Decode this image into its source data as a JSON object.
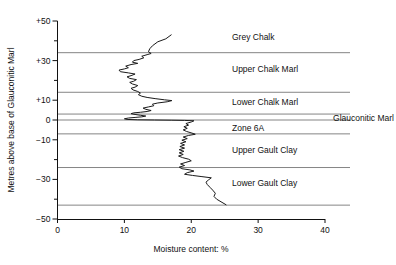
{
  "figure": {
    "background": "#ffffff",
    "line_color": "#1a1a1a",
    "boundary_color": "#777777",
    "axis_color": "#111111"
  },
  "chart_data": {
    "type": "line",
    "title": "",
    "xlabel": "Moisture content: %",
    "ylabel": "Metres above base of Glauconitic Marl",
    "xlim": [
      0,
      40
    ],
    "ylim": [
      -50,
      50
    ],
    "grid": false,
    "legend_position": "none",
    "orientation": "vertical-profile",
    "xticks": [
      0,
      10,
      20,
      30,
      40
    ],
    "xtick_labels": [
      "0",
      "10",
      "20",
      "30",
      "40"
    ],
    "yticks": [
      -50,
      -40,
      -30,
      -20,
      -10,
      0,
      10,
      20,
      30,
      40,
      50
    ],
    "ytick_labels": [
      "−50",
      "",
      "−30",
      "",
      "−10",
      "0",
      "+10",
      "",
      "+30",
      "",
      "+50"
    ],
    "series": [
      {
        "name": "Moisture content profile",
        "x_is_value": true,
        "points": [
          [
            17.0,
            43.0
          ],
          [
            16.2,
            41.0
          ],
          [
            15.0,
            39.5
          ],
          [
            14.2,
            37.5
          ],
          [
            13.8,
            36.0
          ],
          [
            13.6,
            34.5
          ],
          [
            14.0,
            33.6
          ],
          [
            13.4,
            33.0
          ],
          [
            12.6,
            32.2
          ],
          [
            12.9,
            31.4
          ],
          [
            12.2,
            30.6
          ],
          [
            11.4,
            30.0
          ],
          [
            11.2,
            29.2
          ],
          [
            12.0,
            28.6
          ],
          [
            11.0,
            28.0
          ],
          [
            10.2,
            27.2
          ],
          [
            10.6,
            26.4
          ],
          [
            10.0,
            25.8
          ],
          [
            9.2,
            25.2
          ],
          [
            9.4,
            24.4
          ],
          [
            10.6,
            23.8
          ],
          [
            11.6,
            23.2
          ],
          [
            11.0,
            22.4
          ],
          [
            10.4,
            21.8
          ],
          [
            10.8,
            21.0
          ],
          [
            11.8,
            20.4
          ],
          [
            11.4,
            19.6
          ],
          [
            10.8,
            19.0
          ],
          [
            11.2,
            18.2
          ],
          [
            12.0,
            17.4
          ],
          [
            11.6,
            16.6
          ],
          [
            11.0,
            16.0
          ],
          [
            11.3,
            15.2
          ],
          [
            12.0,
            14.4
          ],
          [
            12.4,
            13.6
          ],
          [
            12.1,
            12.8
          ],
          [
            12.6,
            12.0
          ],
          [
            13.4,
            11.4
          ],
          [
            14.6,
            10.8
          ],
          [
            16.0,
            10.2
          ],
          [
            17.1,
            9.8
          ],
          [
            16.4,
            9.2
          ],
          [
            15.0,
            8.6
          ],
          [
            14.2,
            8.0
          ],
          [
            14.4,
            7.2
          ],
          [
            13.6,
            6.6
          ],
          [
            12.8,
            6.0
          ],
          [
            13.2,
            5.4
          ],
          [
            14.0,
            4.8
          ],
          [
            13.4,
            4.3
          ],
          [
            12.4,
            3.9
          ],
          [
            11.4,
            3.6
          ],
          [
            11.0,
            3.2
          ],
          [
            11.6,
            2.8
          ],
          [
            12.4,
            2.4
          ],
          [
            13.2,
            2.0
          ],
          [
            12.6,
            1.6
          ],
          [
            11.6,
            1.3
          ],
          [
            10.6,
            1.0
          ],
          [
            10.0,
            0.6
          ],
          [
            10.4,
            0.3
          ],
          [
            12.0,
            0.1
          ],
          [
            14.5,
            0.0
          ],
          [
            17.0,
            -0.1
          ],
          [
            19.0,
            -0.2
          ],
          [
            20.4,
            -0.4
          ],
          [
            20.0,
            -1.0
          ],
          [
            19.2,
            -1.8
          ],
          [
            19.6,
            -2.6
          ],
          [
            18.9,
            -3.4
          ],
          [
            19.4,
            -4.2
          ],
          [
            18.8,
            -5.0
          ],
          [
            19.3,
            -5.8
          ],
          [
            20.1,
            -6.6
          ],
          [
            20.6,
            -7.2
          ],
          [
            19.6,
            -7.8
          ],
          [
            18.8,
            -8.6
          ],
          [
            19.4,
            -9.4
          ],
          [
            18.6,
            -10.2
          ],
          [
            19.2,
            -11.0
          ],
          [
            18.4,
            -11.8
          ],
          [
            19.0,
            -12.6
          ],
          [
            18.3,
            -13.4
          ],
          [
            19.0,
            -14.2
          ],
          [
            18.2,
            -15.0
          ],
          [
            18.9,
            -15.8
          ],
          [
            18.2,
            -16.6
          ],
          [
            18.8,
            -17.4
          ],
          [
            18.1,
            -18.2
          ],
          [
            18.7,
            -19.0
          ],
          [
            19.6,
            -19.8
          ],
          [
            20.0,
            -20.6
          ],
          [
            19.2,
            -21.4
          ],
          [
            18.4,
            -22.2
          ],
          [
            19.0,
            -23.0
          ],
          [
            18.2,
            -23.8
          ],
          [
            18.6,
            -24.6
          ],
          [
            19.8,
            -25.2
          ],
          [
            20.4,
            -25.8
          ],
          [
            19.4,
            -26.6
          ],
          [
            19.0,
            -27.4
          ],
          [
            20.2,
            -28.0
          ],
          [
            21.6,
            -28.6
          ],
          [
            23.0,
            -29.2
          ],
          [
            22.6,
            -30.2
          ],
          [
            22.2,
            -31.4
          ],
          [
            22.4,
            -32.6
          ],
          [
            22.8,
            -34.0
          ],
          [
            23.2,
            -35.4
          ],
          [
            23.6,
            -37.0
          ],
          [
            23.4,
            -38.6
          ],
          [
            23.8,
            -40.0
          ],
          [
            24.6,
            -41.6
          ],
          [
            25.2,
            -42.8
          ]
        ]
      }
    ],
    "stratigraphic_units": [
      {
        "label": "Grey Chalk",
        "top": 50,
        "base": 34,
        "label_y": 42
      },
      {
        "label": "Upper Chalk Marl",
        "top": 34,
        "base": 14,
        "label_y": 26
      },
      {
        "label": "Lower Chalk Marl",
        "top": 14,
        "base": 3,
        "label_y": 9
      },
      {
        "label": "Glauconitic Marl",
        "top": 3,
        "base": 0,
        "label_y": 1,
        "label_outside": true
      },
      {
        "label": "Zone 6A",
        "top": 0,
        "base": -7,
        "label_y": -4
      },
      {
        "label": "Upper Gault Clay",
        "top": -7,
        "base": -24,
        "label_y": -15
      },
      {
        "label": "Lower Gault Clay",
        "top": -24,
        "base": -43,
        "label_y": -32
      }
    ],
    "boundary_levels": [
      34,
      14,
      3,
      0,
      -7,
      -24,
      -43
    ]
  }
}
